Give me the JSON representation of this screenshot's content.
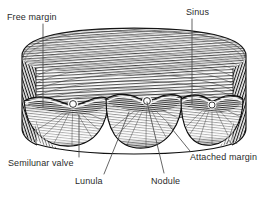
{
  "figure": {
    "style": "pen-and-ink cross-hatch engraving, black on white",
    "background_color": "#ffffff",
    "ink_color": "#1f1f1f",
    "label_color": "#2b2b2b",
    "cusp_count": 3
  },
  "labels": {
    "free_margin": "Free margin",
    "sinus": "Sinus",
    "semilunar_valve": "Semilunar valve",
    "lunula": "Lunula",
    "nodule": "Nodule",
    "attached_margin": "Attached margin"
  },
  "leaders": {
    "free_margin": {
      "x1": 43,
      "y1": 24,
      "x2": 43,
      "y2": 107
    },
    "sinus": {
      "x1": 192,
      "y1": 19,
      "x2": 192,
      "y2": 104
    },
    "semilunar_valve": {
      "x1": 79,
      "y1": 115,
      "x2": 79,
      "y2": 157
    },
    "lunula": {
      "x1": 129,
      "y1": 112,
      "x2": 104,
      "y2": 174
    },
    "nodule": {
      "x1": 147,
      "y1": 102,
      "x2": 164,
      "y2": 173
    },
    "attached_margin": {
      "x1": 168,
      "y1": 124,
      "x2": 190,
      "y2": 151
    }
  },
  "nodules": [
    {
      "cx": 73,
      "cy": 104,
      "r": 3.4
    },
    {
      "cx": 147,
      "cy": 101,
      "r": 3.4
    },
    {
      "cx": 212,
      "cy": 105,
      "r": 3.0
    }
  ]
}
